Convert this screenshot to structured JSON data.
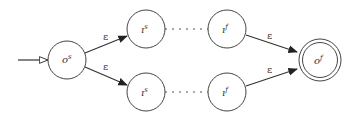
{
  "diagram": {
    "type": "nfa-union-construction",
    "colors": {
      "stroke": "#333333",
      "background": "#ffffff"
    },
    "states": [
      {
        "id": "start",
        "base": "o",
        "sup": "s",
        "cx": 67,
        "cy": 60,
        "r": 19,
        "accepting": false,
        "initial": true
      },
      {
        "id": "upper-in-start",
        "base": "ı",
        "sup": "s",
        "cx": 146,
        "cy": 29,
        "r": 19,
        "accepting": false
      },
      {
        "id": "upper-in-final",
        "base": "ı",
        "sup": "f",
        "cx": 227,
        "cy": 29,
        "r": 19,
        "accepting": false
      },
      {
        "id": "lower-in-start",
        "base": "ı",
        "sup": "s",
        "cx": 146,
        "cy": 92,
        "r": 19,
        "accepting": false
      },
      {
        "id": "lower-in-final",
        "base": "ı",
        "sup": "f",
        "cx": 227,
        "cy": 92,
        "r": 19,
        "accepting": false
      },
      {
        "id": "final",
        "base": "o",
        "sup": "f",
        "cx": 320,
        "cy": 60,
        "r": 21,
        "accepting": true
      }
    ],
    "transitions": [
      {
        "from": "start",
        "to": "upper-in-start",
        "label": "ε"
      },
      {
        "from": "start",
        "to": "lower-in-start",
        "label": "ε"
      },
      {
        "from": "upper-in-final",
        "to": "final",
        "label": "ε"
      },
      {
        "from": "lower-in-final",
        "to": "final",
        "label": "ε"
      }
    ],
    "elided_paths": [
      {
        "from": "upper-in-start",
        "to": "upper-in-final",
        "style": "dotted"
      },
      {
        "from": "lower-in-start",
        "to": "lower-in-final",
        "style": "dotted"
      }
    ],
    "labels": {
      "start_base": "o",
      "start_sup": "s",
      "upper_is_base": "ı",
      "upper_is_sup": "s",
      "upper_if_base": "ı",
      "upper_if_sup": "f",
      "lower_is_base": "ı",
      "lower_is_sup": "s",
      "lower_if_base": "ı",
      "lower_if_sup": "f",
      "final_base": "o",
      "final_sup": "f",
      "eps1": "ε",
      "eps2": "ε",
      "eps3": "ε",
      "eps4": "ε"
    }
  }
}
